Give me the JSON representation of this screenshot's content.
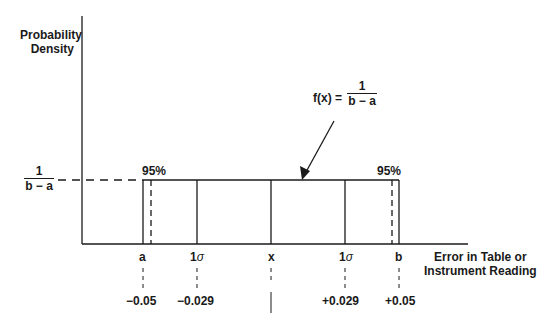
{
  "diagram": {
    "type": "uniform-probability-distribution",
    "y_axis_label": [
      "Probability",
      "Density"
    ],
    "y_level_label": {
      "numerator": "1",
      "denominator": "b − a"
    },
    "function_label": {
      "lhs": "f(x) =",
      "numerator": "1",
      "denominator": "b − a"
    },
    "x_axis_label": [
      "Error in Table or",
      "Instrument Reading"
    ],
    "percent_left": "95%",
    "percent_right": "95%",
    "ticks": [
      {
        "label": "a",
        "value": "−0.05"
      },
      {
        "label": "1",
        "sigma": "σ",
        "value": "−0.029"
      },
      {
        "label": "x",
        "value": ""
      },
      {
        "label": "1",
        "sigma": "σ",
        "value": "+0.029"
      },
      {
        "label": "b",
        "value": "+0.05"
      }
    ]
  }
}
